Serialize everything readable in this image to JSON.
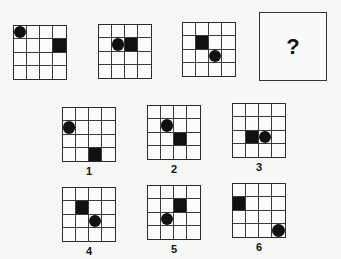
{
  "puzzle": {
    "grid_size": 4,
    "question_mark": "?",
    "sequence": [
      {
        "id": "seq-1",
        "x": 13,
        "y": 25,
        "circle": [
          0,
          0
        ],
        "square": [
          1,
          3
        ]
      },
      {
        "id": "seq-2",
        "x": 98,
        "y": 24,
        "circle": [
          1,
          1
        ],
        "square": [
          1,
          2
        ]
      },
      {
        "id": "seq-3",
        "x": 182,
        "y": 22,
        "circle": [
          2,
          2
        ],
        "square": [
          1,
          1
        ]
      }
    ],
    "options": [
      {
        "label": "1",
        "x": 62,
        "y": 107,
        "circle": [
          1,
          0
        ],
        "square": [
          3,
          2
        ]
      },
      {
        "label": "2",
        "x": 147,
        "y": 105,
        "circle": [
          1,
          1
        ],
        "square": [
          2,
          2
        ]
      },
      {
        "label": "3",
        "x": 232,
        "y": 103,
        "circle": [
          2,
          2
        ],
        "square": [
          2,
          1
        ]
      },
      {
        "label": "4",
        "x": 62,
        "y": 187,
        "circle": [
          2,
          2
        ],
        "square": [
          1,
          1
        ]
      },
      {
        "label": "5",
        "x": 147,
        "y": 185,
        "circle": [
          2,
          1
        ],
        "square": [
          1,
          2
        ]
      },
      {
        "label": "6",
        "x": 232,
        "y": 183,
        "circle": [
          3,
          3
        ],
        "square": [
          1,
          0
        ]
      }
    ]
  }
}
